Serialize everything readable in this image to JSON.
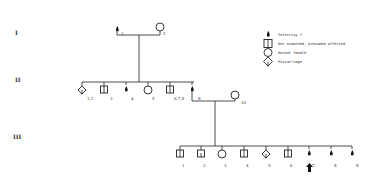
{
  "generations": [
    {
      "label": "I",
      "y": 33
    },
    {
      "label": "II",
      "y": 80
    },
    {
      "label": "III",
      "y": 137
    }
  ],
  "legend": [
    {
      "symbol": "affected-male",
      "label": "Selectisy Y"
    },
    {
      "symbol": "split-square",
      "label": "Not examined, presumed affected"
    },
    {
      "symbol": "circle",
      "label": "Normal female"
    },
    {
      "symbol": "diamond",
      "label": "Miscarriage"
    }
  ],
  "gen1": [
    {
      "id": "1",
      "type": "affected",
      "x": 117
    },
    {
      "id": "2",
      "type": "circle",
      "x": 160
    }
  ],
  "gen2": [
    {
      "id": "1,2",
      "type": "diamond",
      "x": 82
    },
    {
      "id": "3",
      "type": "split-square",
      "x": 104
    },
    {
      "id": "4",
      "type": "affected",
      "x": 126
    },
    {
      "id": "5",
      "type": "circle",
      "x": 148
    },
    {
      "id": "6,7,8",
      "type": "split-square",
      "x": 170
    },
    {
      "id": "9",
      "type": "affected",
      "x": 192
    },
    {
      "id": "10",
      "type": "circle",
      "x": 235
    }
  ],
  "gen3": [
    {
      "id": "1",
      "type": "split-square",
      "x": 180
    },
    {
      "id": "2",
      "type": "split-square",
      "x": 201
    },
    {
      "id": "3",
      "type": "circle",
      "x": 222
    },
    {
      "id": "4",
      "type": "split-square",
      "x": 244
    },
    {
      "id": "5",
      "type": "diamond",
      "x": 266
    },
    {
      "id": "6",
      "type": "split-square",
      "x": 288
    },
    {
      "id": "7",
      "type": "affected",
      "x": 309,
      "proband": true
    },
    {
      "id": "8",
      "type": "affected",
      "x": 331
    },
    {
      "id": "9",
      "type": "affected",
      "x": 352
    }
  ]
}
